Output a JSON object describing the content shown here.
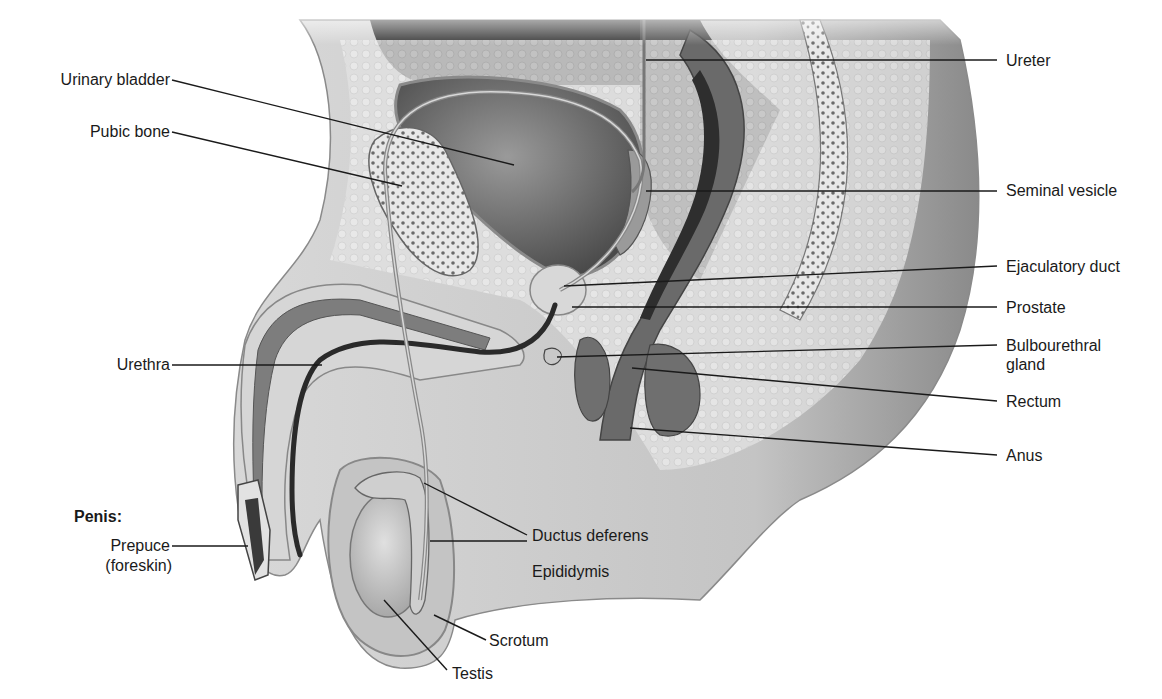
{
  "figure": {
    "heading_label": "Penis:",
    "labels_left": [
      {
        "id": "urinary-bladder",
        "text": "Urinary bladder"
      },
      {
        "id": "pubic-bone",
        "text": "Pubic bone"
      },
      {
        "id": "urethra",
        "text": "Urethra"
      },
      {
        "id": "prepuce",
        "text": "Prepuce",
        "text2": "(foreskin)"
      }
    ],
    "labels_right": [
      {
        "id": "ureter",
        "text": "Ureter"
      },
      {
        "id": "seminal-vesicle",
        "text": "Seminal vesicle"
      },
      {
        "id": "ejaculatory-duct",
        "text": "Ejaculatory duct"
      },
      {
        "id": "prostate",
        "text": "Prostate"
      },
      {
        "id": "bulbourethral-gland",
        "text": "Bulbourethral",
        "text2": "gland"
      },
      {
        "id": "rectum",
        "text": "Rectum"
      },
      {
        "id": "anus",
        "text": "Anus"
      }
    ],
    "labels_bottom": [
      {
        "id": "ductus-deferens",
        "text": "Ductus deferens"
      },
      {
        "id": "epididymis",
        "text": "Epididymis"
      },
      {
        "id": "scrotum",
        "text": "Scrotum"
      },
      {
        "id": "testis",
        "text": "Testis"
      }
    ],
    "colors": {
      "skin": "#cfcfcf",
      "tissue_light": "#e6e6e6",
      "tissue_mid": "#b5b5b5",
      "organ_dark": "#5a5a5a",
      "cavity": "#3a3a3a",
      "leader_line": "#1a1a1a"
    }
  }
}
